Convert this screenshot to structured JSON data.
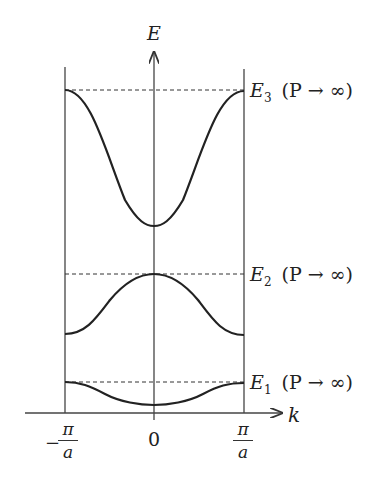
{
  "diagram": {
    "type": "band-structure",
    "axes": {
      "y_label": "E",
      "x_label": "k",
      "x_ticks": [
        {
          "num": "π",
          "den": "a",
          "sign": "−"
        },
        {
          "value": "0"
        },
        {
          "num": "π",
          "den": "a",
          "sign": ""
        }
      ]
    },
    "levels": [
      {
        "name": "E3",
        "base": "E",
        "sub": "3",
        "condition": "(P → ∞)"
      },
      {
        "name": "E2",
        "base": "E",
        "sub": "2",
        "condition": "(P → ∞)"
      },
      {
        "name": "E1",
        "base": "E",
        "sub": "1",
        "condition": "(P → ∞)"
      }
    ],
    "colors": {
      "line": "#222222",
      "axis": "#444444",
      "background": "#ffffff"
    }
  }
}
